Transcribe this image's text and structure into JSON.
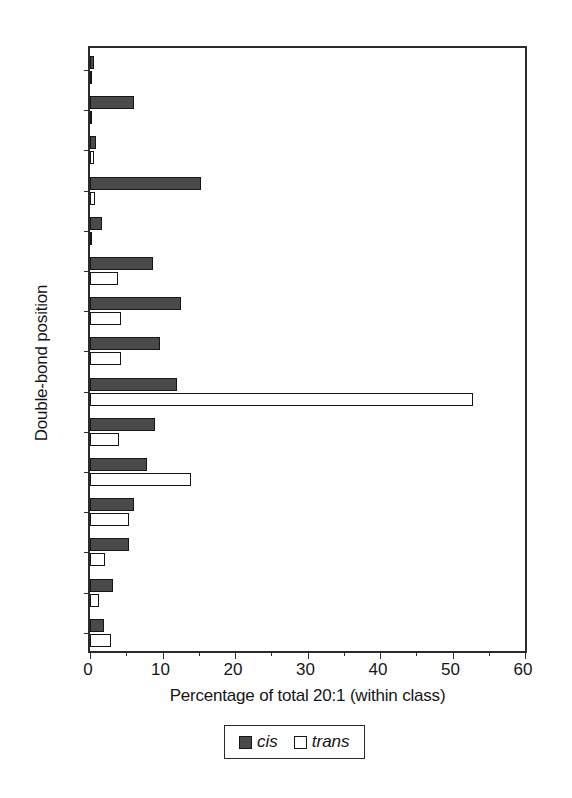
{
  "chart_data": {
    "type": "bar",
    "orientation": "horizontal",
    "title": "",
    "xlabel": "Percentage of total 20:1 (within class)",
    "ylabel": "Double-bond position",
    "categories": [
      "3",
      "4",
      "5",
      "6",
      "7",
      "8",
      "9",
      "10",
      "11",
      "12",
      "13",
      "14",
      "15",
      "16",
      "17"
    ],
    "series": [
      {
        "name": "cis",
        "color": "#4a4a4a",
        "values": [
          0.6,
          6.0,
          0.8,
          15.3,
          1.7,
          8.7,
          12.5,
          9.6,
          12.0,
          9.0,
          7.9,
          6.0,
          5.4,
          3.2,
          1.9
        ]
      },
      {
        "name": "trans",
        "color": "#ffffff",
        "values": [
          0.1,
          0.3,
          0.6,
          0.7,
          0.1,
          3.9,
          4.3,
          4.3,
          52.8,
          4.0,
          13.9,
          5.4,
          2.0,
          1.2,
          2.9
        ]
      }
    ],
    "xlim": [
      0,
      60
    ],
    "xticks": [
      0,
      10,
      20,
      30,
      40,
      50,
      60
    ],
    "xtick_labels": [
      "0",
      "10",
      "20",
      "30",
      "40",
      "50",
      "60"
    ],
    "x_minor_ticks": [
      5,
      15,
      25,
      35,
      45,
      55
    ],
    "grid": false,
    "legend_position": "below-center",
    "legend": [
      {
        "label": "cis",
        "swatch": "filled-dark-square"
      },
      {
        "label": "trans",
        "swatch": "open-white-square"
      }
    ]
  }
}
